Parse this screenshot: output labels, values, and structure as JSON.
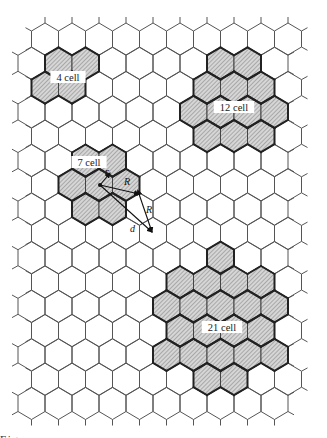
{
  "figure": {
    "grid": {
      "rows": 16,
      "first_row_top_vertex_y": 23,
      "row_spacing": 24.3,
      "col_spacing": 27,
      "hex_radius": 16,
      "even_row_first_center_x": 45,
      "odd_row_first_center_x": 31.5,
      "even_row_last_center_x": 288,
      "odd_row_last_center_x": 274.5,
      "line_color": "#555555",
      "cluster_outline_color": "#222222",
      "hatch_color": "#777777",
      "fill_color": "#d4d4d4"
    },
    "clusters": [
      {
        "label": "4 cell",
        "label_pos": [
          68,
          78
        ],
        "cells": [
          [
            1,
            58.5
          ],
          [
            1,
            85.5
          ],
          [
            2,
            45
          ],
          [
            2,
            72
          ]
        ]
      },
      {
        "label": "12 cell",
        "label_pos": [
          234,
          108
        ],
        "cells": [
          [
            1,
            220.5
          ],
          [
            1,
            247.5
          ],
          [
            2,
            207
          ],
          [
            2,
            234
          ],
          [
            2,
            261
          ],
          [
            3,
            193.5
          ],
          [
            3,
            220.5
          ],
          [
            3,
            247.5
          ],
          [
            3,
            274.5
          ],
          [
            4,
            207
          ],
          [
            4,
            234
          ],
          [
            4,
            261
          ]
        ]
      },
      {
        "label": "7 cell",
        "label_pos": [
          89,
          163
        ],
        "cells": [
          [
            5,
            85.5
          ],
          [
            5,
            112.5
          ],
          [
            6,
            72
          ],
          [
            6,
            99
          ],
          [
            6,
            126
          ],
          [
            7,
            85.5
          ],
          [
            7,
            112.5
          ]
        ]
      },
      {
        "label": "21 cell",
        "label_pos": [
          222,
          328
        ],
        "cells": [
          [
            9,
            220.5
          ],
          [
            10,
            180
          ],
          [
            10,
            207
          ],
          [
            10,
            234
          ],
          [
            10,
            261
          ],
          [
            11,
            166.5
          ],
          [
            11,
            193.5
          ],
          [
            11,
            220.5
          ],
          [
            11,
            247.5
          ],
          [
            11,
            274.5
          ],
          [
            12,
            180
          ],
          [
            12,
            207
          ],
          [
            12,
            234
          ],
          [
            12,
            261
          ],
          [
            13,
            166.5
          ],
          [
            13,
            193.5
          ],
          [
            13,
            220.5
          ],
          [
            13,
            247.5
          ],
          [
            13,
            274.5
          ],
          [
            14,
            207
          ],
          [
            14,
            234
          ]
        ]
      }
    ],
    "annotations": {
      "center_point": [
        100,
        185
      ],
      "arrows": [
        {
          "name": "r",
          "label": "r",
          "from": [
            100,
            185
          ],
          "to": [
            110,
            173
          ],
          "label_pos": [
            105,
            175
          ]
        },
        {
          "name": "R-horizontal",
          "label": "R",
          "from": [
            100,
            185
          ],
          "to": [
            139,
            194
          ],
          "label_pos": [
            124,
            185
          ]
        },
        {
          "name": "R-vertical",
          "label": "R",
          "from": [
            139,
            194
          ],
          "to": [
            152,
            232
          ],
          "label_pos": [
            146,
            213
          ]
        },
        {
          "name": "d",
          "label": "d",
          "from": [
            100,
            185
          ],
          "to": [
            152,
            232
          ],
          "label_pos": [
            130,
            232
          ]
        }
      ]
    },
    "caption_clipped": "Fig. · · · · · · · · · · · · · · · · · · · · · · · · · ·"
  }
}
